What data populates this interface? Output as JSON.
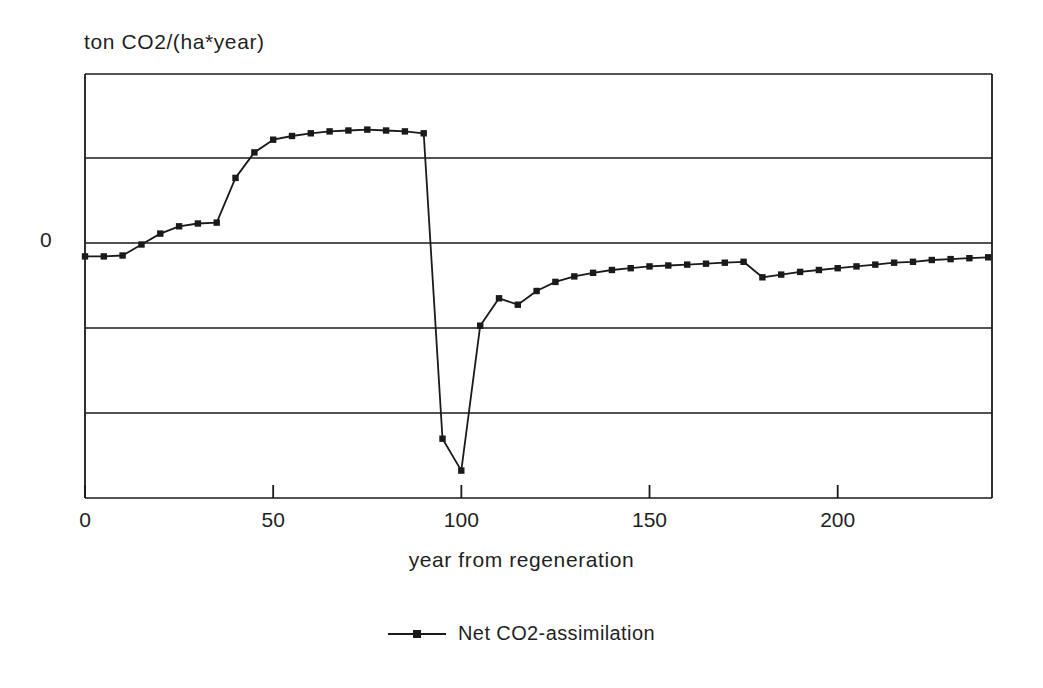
{
  "chart_data": {
    "type": "line",
    "title": "",
    "ylabel": "ton CO2/(ha*year)",
    "xlabel": "year from regeneration",
    "y_axis_origin_label": "0",
    "xlim": [
      0,
      241
    ],
    "ylim": [
      -2.65,
      2.0
    ],
    "xticks": [
      0,
      50,
      100,
      150,
      200
    ],
    "xticklabels": [
      "0",
      "50",
      "100",
      "150",
      "200"
    ],
    "yticks": [
      -2,
      -1,
      0,
      1,
      2
    ],
    "yticklabels": [
      "",
      "",
      "0",
      "",
      ""
    ],
    "grid": "horizontal",
    "legend_position": "bottom-center",
    "series": [
      {
        "name": "Net CO2-assimilation",
        "marker": "square",
        "color": "#1a1a1a",
        "x": [
          0,
          5,
          10,
          15,
          20,
          25,
          30,
          35,
          40,
          45,
          50,
          55,
          60,
          65,
          70,
          75,
          80,
          85,
          90,
          95,
          100,
          105,
          110,
          115,
          120,
          125,
          130,
          135,
          140,
          145,
          150,
          155,
          160,
          165,
          170,
          175,
          180,
          185,
          190,
          195,
          200,
          205,
          210,
          215,
          220,
          225,
          230,
          235,
          240
        ],
        "y": [
          0.0,
          0.0,
          0.01,
          0.13,
          0.25,
          0.33,
          0.36,
          0.37,
          0.86,
          1.14,
          1.28,
          1.32,
          1.35,
          1.37,
          1.38,
          1.39,
          1.38,
          1.37,
          1.35,
          -2.0,
          -2.35,
          -0.76,
          -0.46,
          -0.53,
          -0.38,
          -0.28,
          -0.22,
          -0.18,
          -0.15,
          -0.13,
          -0.11,
          -0.1,
          -0.09,
          -0.08,
          -0.07,
          -0.06,
          -0.23,
          -0.2,
          -0.17,
          -0.15,
          -0.13,
          -0.11,
          -0.09,
          -0.07,
          -0.06,
          -0.04,
          -0.03,
          -0.02,
          -0.01
        ]
      }
    ],
    "annotations": {
      "plateau_peak_value": 1.39,
      "minimum_value": -2.35,
      "minimum_year": 100,
      "disturbance_year": 90
    }
  },
  "legend": {
    "entries": [
      {
        "label": "Net CO2-assimilation"
      }
    ]
  }
}
